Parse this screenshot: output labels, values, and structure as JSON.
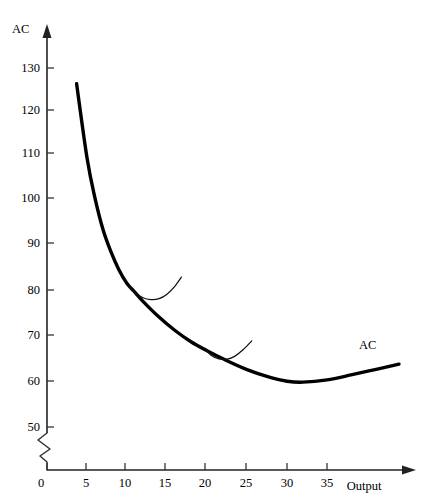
{
  "chart_data": {
    "type": "line",
    "title": "",
    "xlabel": "Output",
    "ylabel": "AC",
    "xlim": [
      0,
      44
    ],
    "ylim": [
      45,
      136
    ],
    "grid": false,
    "legend_position": "inline-right",
    "y_axis_break": true,
    "y_ticks": [
      50,
      60,
      70,
      80,
      90,
      100,
      110,
      120,
      130
    ],
    "x_ticks": [
      0,
      5,
      10,
      15,
      20,
      25,
      30,
      35
    ],
    "series": [
      {
        "name": "AC",
        "label": "AC",
        "role": "long-run-average-cost-envelope",
        "x": [
          3.7,
          5,
          6,
          7,
          8,
          9,
          10,
          11,
          12,
          14,
          16,
          18,
          20,
          22,
          25,
          28,
          30,
          32,
          35,
          38,
          41,
          44
        ],
        "values": [
          126.5,
          110,
          101,
          94,
          89,
          85,
          82,
          80,
          78,
          74.5,
          71.5,
          69,
          67,
          65.2,
          62.8,
          61,
          60.2,
          60,
          60.5,
          61.6,
          62.8,
          64
        ]
      },
      {
        "name": "SRAC1",
        "label": "",
        "role": "short-run-average-cost-tangent",
        "x": [
          10.2,
          11,
          12,
          13,
          14,
          15,
          16,
          16.8
        ],
        "values": [
          81.5,
          80,
          78.8,
          78.4,
          78.6,
          79.6,
          81.4,
          83.4
        ]
      },
      {
        "name": "SRAC2",
        "label": "",
        "role": "short-run-average-cost-tangent",
        "x": [
          19.8,
          20.5,
          21.5,
          22.5,
          23.5,
          24.5,
          25.6
        ],
        "values": [
          67.5,
          66,
          65.2,
          65.1,
          65.8,
          67.2,
          69.2
        ]
      }
    ],
    "annotations": [
      {
        "text": "AC",
        "x": 40,
        "y": 68,
        "note": "curve label at right end of envelope"
      }
    ]
  },
  "colors": {
    "background": "#ffffff",
    "curve": "#000000",
    "axis": "#222222",
    "text": "#000000"
  },
  "labels": {
    "y_axis_title": "AC",
    "x_axis_title": "Output",
    "curve_name": "AC"
  }
}
